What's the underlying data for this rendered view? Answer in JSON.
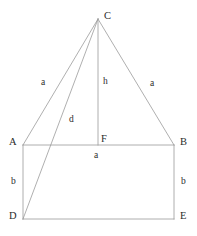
{
  "figure": {
    "background_color": "#ffffff",
    "stroke_color": "#9a9a9a",
    "text_color": "#2b2b2b",
    "stroke_width": 0.8
  },
  "vertices": [
    {
      "id": "C",
      "label": "C",
      "x": 98,
      "y": 19,
      "label_x": 104,
      "label_y": 11
    },
    {
      "id": "A",
      "label": "A",
      "x": 23,
      "y": 145,
      "label_x": 9,
      "label_y": 137
    },
    {
      "id": "B",
      "label": "B",
      "x": 174,
      "y": 145,
      "label_x": 180,
      "label_y": 137
    },
    {
      "id": "F",
      "label": "F",
      "x": 98,
      "y": 145,
      "label_x": 101,
      "label_y": 134
    },
    {
      "id": "D",
      "label": "D",
      "x": 23,
      "y": 219,
      "label_x": 9,
      "label_y": 211
    },
    {
      "id": "E",
      "label": "E",
      "x": 174,
      "y": 219,
      "label_x": 180,
      "label_y": 211
    }
  ],
  "edges": [
    {
      "id": "CA",
      "from": "C",
      "to": "A",
      "x1": 98,
      "y1": 19,
      "x2": 23,
      "y2": 145
    },
    {
      "id": "CB",
      "from": "C",
      "to": "B",
      "x1": 98,
      "y1": 19,
      "x2": 174,
      "y2": 145
    },
    {
      "id": "CF",
      "from": "C",
      "to": "F",
      "x1": 98,
      "y1": 19,
      "x2": 98,
      "y2": 145
    },
    {
      "id": "CD",
      "from": "C",
      "to": "D",
      "x1": 98,
      "y1": 19,
      "x2": 23,
      "y2": 219
    },
    {
      "id": "AB",
      "from": "A",
      "to": "B",
      "x1": 23,
      "y1": 145,
      "x2": 174,
      "y2": 145
    },
    {
      "id": "AD",
      "from": "A",
      "to": "D",
      "x1": 23,
      "y1": 145,
      "x2": 23,
      "y2": 219
    },
    {
      "id": "BE",
      "from": "B",
      "to": "E",
      "x1": 174,
      "y1": 145,
      "x2": 174,
      "y2": 219
    },
    {
      "id": "DE",
      "from": "D",
      "to": "E",
      "x1": 23,
      "y1": 219,
      "x2": 174,
      "y2": 219
    }
  ],
  "measures": [
    {
      "id": "side-a-left",
      "label": "a",
      "edge": "CA",
      "x": 41,
      "y": 78
    },
    {
      "id": "side-a-right",
      "label": "a",
      "edge": "CB",
      "x": 150,
      "y": 79
    },
    {
      "id": "height-h",
      "label": "h",
      "edge": "CF",
      "x": 103,
      "y": 77
    },
    {
      "id": "diagonal-d",
      "label": "d",
      "edge": "CD",
      "x": 69,
      "y": 115
    },
    {
      "id": "base-a-bottom",
      "label": "a",
      "edge": "AB",
      "x": 94,
      "y": 151
    },
    {
      "id": "side-b-left",
      "label": "b",
      "edge": "AD",
      "x": 11,
      "y": 177
    },
    {
      "id": "side-b-right",
      "label": "b",
      "edge": "BE",
      "x": 181,
      "y": 177
    }
  ]
}
